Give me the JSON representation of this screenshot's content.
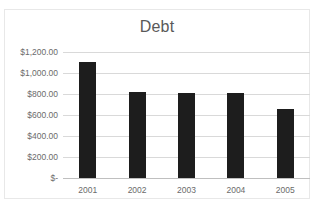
{
  "chart_data": {
    "type": "bar",
    "title": "Debt",
    "xlabel": "",
    "ylabel": "",
    "categories": [
      "2001",
      "2002",
      "2003",
      "2004",
      "2005"
    ],
    "values": [
      1105,
      818,
      812,
      805,
      655
    ],
    "ylim": [
      0,
      1200
    ],
    "yticks": [
      0,
      200,
      400,
      600,
      800,
      1000,
      1200
    ],
    "ytick_labels": [
      "$-",
      "$200.00",
      "$400.00",
      "$600.00",
      "$800.00",
      "$1,000.00",
      "$1,200.00"
    ],
    "grid": true,
    "legend": false,
    "series": [
      {
        "name": "Debt",
        "values": [
          1105,
          818,
          812,
          805,
          655
        ],
        "color": "#1d1d1d"
      }
    ],
    "colors": {
      "bar": "#1d1d1d",
      "gridline": "#d9d9d9",
      "axis": "#bfbfbf",
      "text": "#6b6b6b",
      "title": "#595959",
      "background": "#ffffff",
      "frame_border": "#e8e8e8"
    }
  }
}
